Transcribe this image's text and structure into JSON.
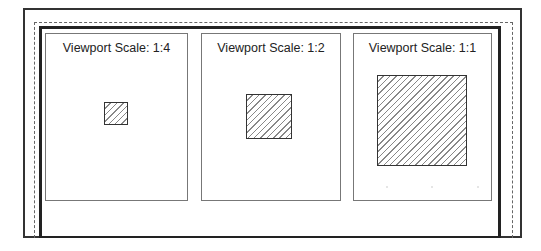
{
  "layout": {
    "outer_frame": "paper-border",
    "dashed_frame": "printable-area",
    "inner_frame": "drawing-border"
  },
  "viewports": [
    {
      "label": "Viewport Scale: 1:4",
      "scale": "1:4",
      "object": "hatched-square"
    },
    {
      "label": "Viewport Scale: 1:2",
      "scale": "1:2",
      "object": "hatched-square"
    },
    {
      "label": "Viewport Scale: 1:1",
      "scale": "1:1",
      "object": "hatched-square"
    }
  ],
  "colors": {
    "frame": "#333333",
    "hatch": "#888888",
    "viewport_border": "#777777"
  }
}
